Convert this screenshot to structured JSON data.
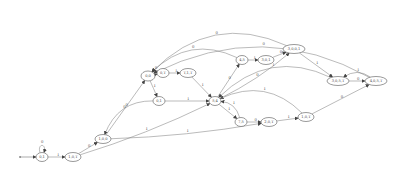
{
  "diagram": {
    "type": "state-machine",
    "start_state": "q0",
    "nodes": [
      {
        "id": "q0",
        "label": "0,1",
        "x": 42,
        "y": 157,
        "rx": 6,
        "ry": 4.5
      },
      {
        "id": "q1",
        "label": "1,0,T",
        "x": 73,
        "y": 157,
        "rx": 8,
        "ry": 4.5
      },
      {
        "id": "q2",
        "label": "1,0,0",
        "x": 103,
        "y": 139,
        "rx": 8,
        "ry": 4.5
      },
      {
        "id": "q3",
        "label": "0,0",
        "x": 148,
        "y": 76,
        "rx": 7,
        "ry": 5
      },
      {
        "id": "q4",
        "label": "0,T",
        "x": 163,
        "y": 73,
        "rx": 6,
        "ry": 4.5
      },
      {
        "id": "q5",
        "label": "0,1",
        "x": 159,
        "y": 101,
        "rx": 6,
        "ry": 4.5
      },
      {
        "id": "q6",
        "label": "T,1,T",
        "x": 188,
        "y": 73,
        "rx": 8,
        "ry": 4.5
      },
      {
        "id": "q7",
        "label": "4,5",
        "x": 242,
        "y": 60,
        "rx": 6,
        "ry": 4.5
      },
      {
        "id": "q8",
        "label": "3,0,1",
        "x": 266,
        "y": 60,
        "rx": 8,
        "ry": 4.5
      },
      {
        "id": "q9",
        "label": "3,0,0,1",
        "x": 294,
        "y": 49,
        "rx": 11,
        "ry": 4.5
      },
      {
        "id": "q10",
        "label": "5,4",
        "x": 215,
        "y": 101,
        "rx": 6,
        "ry": 4.5
      },
      {
        "id": "q11",
        "label": "7,5",
        "x": 241,
        "y": 122,
        "rx": 6,
        "ry": 4.5
      },
      {
        "id": "q12",
        "label": "2,0,T",
        "x": 269,
        "y": 122,
        "rx": 8,
        "ry": 4.5
      },
      {
        "id": "q13",
        "label": "1,0,T",
        "x": 306,
        "y": 117,
        "rx": 8,
        "ry": 4.5
      },
      {
        "id": "q14",
        "label": "3,0,5,T",
        "x": 338,
        "y": 81,
        "rx": 11,
        "ry": 4.5
      },
      {
        "id": "q15",
        "label": "4,0,5,T",
        "x": 376,
        "y": 81,
        "rx": 11,
        "ry": 4.5
      }
    ],
    "edges": [
      {
        "from": "q0",
        "to": "q0",
        "label": "0"
      },
      {
        "from": "q0",
        "to": "q1",
        "label": "1"
      },
      {
        "from": "q1",
        "to": "q2",
        "label": "0"
      },
      {
        "from": "q1",
        "to": "q10",
        "label": "1"
      },
      {
        "from": "q2",
        "to": "q3",
        "label": "0"
      },
      {
        "from": "q2",
        "to": "q12",
        "label": "1"
      },
      {
        "from": "q3",
        "to": "q4",
        "label": "0"
      },
      {
        "from": "q4",
        "to": "q3",
        "label": "0"
      },
      {
        "from": "q3",
        "to": "q5",
        "label": "1"
      },
      {
        "from": "q4",
        "to": "q6",
        "label": "1"
      },
      {
        "from": "q5",
        "to": "q2",
        "label": "0"
      },
      {
        "from": "q5",
        "to": "q10",
        "label": "1"
      },
      {
        "from": "q6",
        "to": "q10",
        "label": "1"
      },
      {
        "from": "q7",
        "to": "q3",
        "label": "0"
      },
      {
        "from": "q7",
        "to": "q8",
        "label": "1"
      },
      {
        "from": "q8",
        "to": "q9",
        "label": "0"
      },
      {
        "from": "q9",
        "to": "q3",
        "label": "0"
      },
      {
        "from": "q9",
        "to": "q14",
        "label": "1"
      },
      {
        "from": "q10",
        "to": "q7",
        "label": "0"
      },
      {
        "from": "q10",
        "to": "q11",
        "label": "1"
      },
      {
        "from": "q11",
        "to": "q10",
        "label": "1"
      },
      {
        "from": "q11",
        "to": "q12",
        "label": "0"
      },
      {
        "from": "q12",
        "to": "q13",
        "label": "1"
      },
      {
        "from": "q13",
        "to": "q10",
        "label": "1"
      },
      {
        "from": "q13",
        "to": "q15",
        "label": "0"
      },
      {
        "from": "q14",
        "to": "q15",
        "label": "0"
      },
      {
        "from": "q15",
        "to": "q14",
        "label": "1"
      },
      {
        "from": "q14",
        "to": "q10",
        "label": "1"
      },
      {
        "from": "q15",
        "to": "q3",
        "label": "0"
      },
      {
        "from": "q10",
        "to": "q9",
        "label": "0"
      }
    ],
    "colors": {
      "stroke": "#555555",
      "text": "#444444",
      "background": "#ffffff"
    }
  }
}
